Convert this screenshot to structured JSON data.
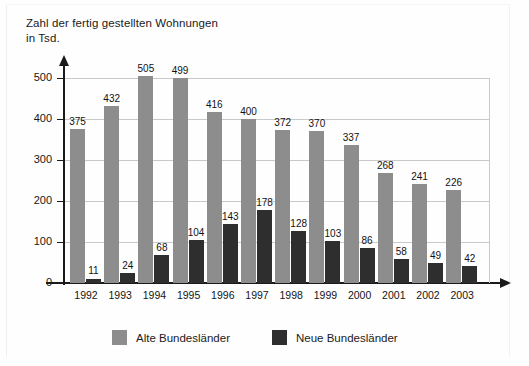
{
  "chart_data": {
    "type": "bar",
    "title": "Zahl der fertig gestellten Wohnungen\nin Tsd.",
    "xlabel": "",
    "ylabel": "",
    "ylim": [
      0,
      500
    ],
    "yticks": [
      0,
      100,
      200,
      300,
      400,
      500
    ],
    "ytick_labels": [
      "0",
      "100",
      "200",
      "300",
      "400",
      "500"
    ],
    "grid": true,
    "legend_position": "bottom",
    "categories": [
      "1992",
      "1993",
      "1994",
      "1995",
      "1996",
      "1997",
      "1998",
      "1999",
      "2000",
      "2001",
      "2002",
      "2003"
    ],
    "series": [
      {
        "name": "Alte Bundesländer",
        "color": "#8d8d8d",
        "values": [
          375,
          432,
          505,
          499,
          416,
          400,
          372,
          370,
          337,
          268,
          241,
          226
        ]
      },
      {
        "name": "Neue Bundesländer",
        "color": "#2e2e2e",
        "values": [
          11,
          24,
          68,
          104,
          143,
          178,
          128,
          103,
          86,
          58,
          49,
          42
        ]
      }
    ]
  },
  "legend": {
    "items": [
      {
        "label": "Alte Bundesländer",
        "swatch": "alt"
      },
      {
        "label": "Neue Bundesländer",
        "swatch": "neu"
      }
    ]
  }
}
